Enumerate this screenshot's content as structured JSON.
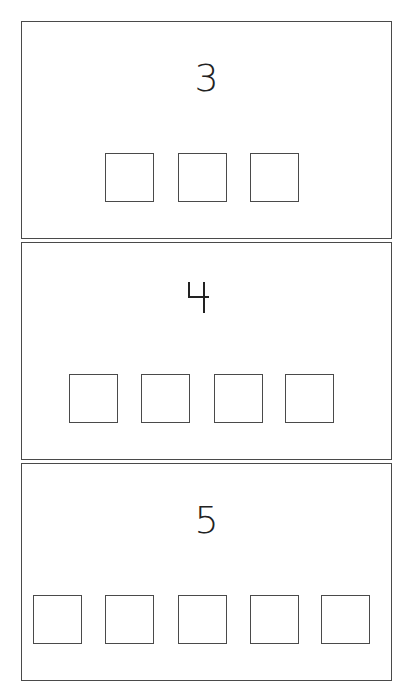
{
  "worksheet": {
    "panels": [
      {
        "number": "3",
        "box_count": 3
      },
      {
        "number": "4",
        "box_count": 4
      },
      {
        "number": "5",
        "box_count": 5
      }
    ],
    "colors": {
      "line": "#4a4a4a",
      "text": "#222222",
      "background": "#ffffff"
    }
  }
}
